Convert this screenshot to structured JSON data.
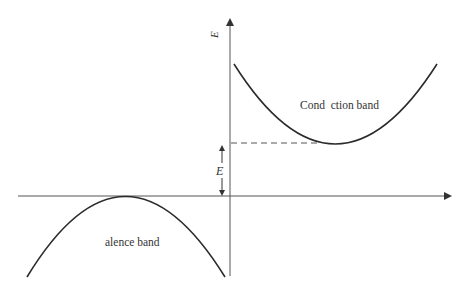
{
  "diagram": {
    "type": "energy-band-diagram",
    "labels": {
      "y_axis": "E",
      "gap": "E",
      "conduction_band": "Cond  ction band",
      "valence_band": "alence band"
    },
    "colors": {
      "curve": "#2b2b2b",
      "axis": "#444444",
      "text": "#333333"
    }
  }
}
